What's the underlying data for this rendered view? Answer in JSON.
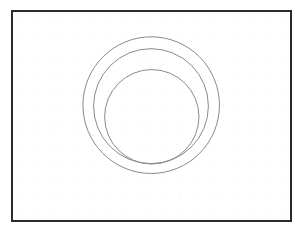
{
  "app": {
    "title": "Concentric Circles Sketch Canvas",
    "background_color": "#ffffff"
  },
  "canvas": {
    "name": "drawing-canvas",
    "width": 307,
    "height": 236,
    "frame": {
      "x": 11,
      "y": 10,
      "width": 281,
      "height": 212,
      "border_color": "#2b2b2b",
      "border_width": 2.5,
      "fill_color": "#ffffff"
    },
    "grid": {
      "type": "dot",
      "visible": true,
      "spacing": 14.5,
      "offset_x": 7,
      "offset_y": 7,
      "dot_radius": 0.75,
      "dot_color": "#efefef"
    }
  },
  "chart_data": {
    "type": "scatter",
    "title": "",
    "xlabel": "",
    "ylabel": "",
    "grid": true,
    "legend": "none",
    "xlim": [
      0,
      281
    ],
    "ylim": [
      0,
      212
    ],
    "shapes": [
      {
        "name": "outer-circle",
        "kind": "circle",
        "cx": 137.7,
        "cy": 92.7,
        "r": 68.0,
        "stroke": "#8a8a8a",
        "stroke_width": 1.0,
        "fill": "none"
      },
      {
        "name": "middle-circle",
        "kind": "circle",
        "cx": 137.5,
        "cy": 93.7,
        "r": 57.2,
        "stroke": "#8a8a8a",
        "stroke_width": 1.0,
        "fill": "none"
      },
      {
        "name": "inner-circle",
        "kind": "circle",
        "cx": 138.3,
        "cy": 104.3,
        "r": 47.0,
        "stroke": "#8a8a8a",
        "stroke_width": 1.0,
        "fill": "none"
      }
    ]
  }
}
